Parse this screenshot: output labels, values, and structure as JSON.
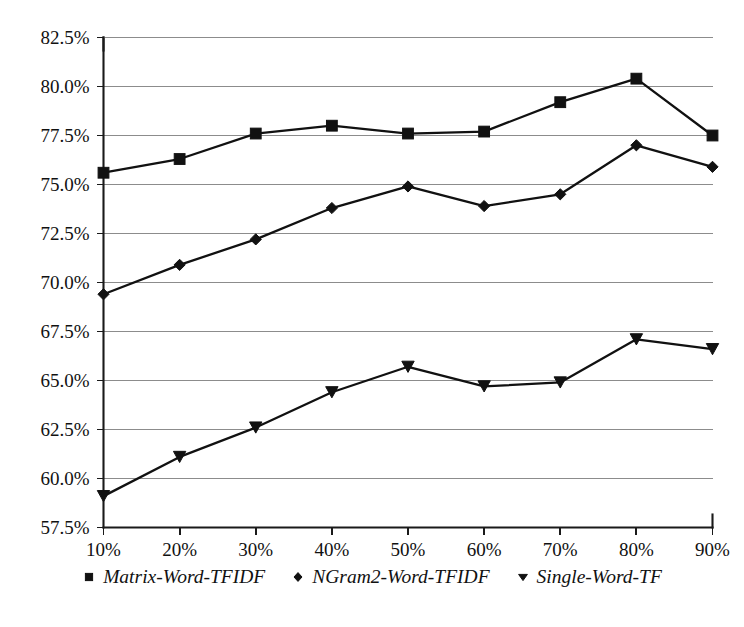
{
  "chart_data": {
    "type": "line",
    "title": "",
    "xlabel": "",
    "ylabel": "",
    "categories": [
      "10%",
      "20%",
      "30%",
      "40%",
      "50%",
      "60%",
      "70%",
      "80%",
      "90%"
    ],
    "x": [
      10,
      20,
      30,
      40,
      50,
      60,
      70,
      80,
      90
    ],
    "xlim": [
      10,
      90
    ],
    "ylim": [
      57.5,
      82.5
    ],
    "grid": true,
    "legend_position": "bottom",
    "y_ticks": [
      57.5,
      60.0,
      62.5,
      65.0,
      67.5,
      70.0,
      72.5,
      75.0,
      77.5,
      80.0,
      82.5
    ],
    "y_tick_labels": [
      "57.5%",
      "60.0%",
      "62.5%",
      "65.0%",
      "67.5%",
      "70.0%",
      "72.5%",
      "75.0%",
      "77.5%",
      "80.0%",
      "82.5%"
    ],
    "x_tick_labels": [
      "10%",
      "20%",
      "30%",
      "40%",
      "50%",
      "60%",
      "70%",
      "80%",
      "90%"
    ],
    "series": [
      {
        "name": "Matrix-Word-TFIDF",
        "marker": "square",
        "values": [
          75.6,
          76.3,
          77.6,
          78.0,
          77.6,
          77.7,
          79.2,
          80.4,
          77.5
        ]
      },
      {
        "name": "NGram2-Word-TFIDF",
        "marker": "diamond",
        "values": [
          69.4,
          70.9,
          72.2,
          73.8,
          74.9,
          73.9,
          74.5,
          77.0,
          75.9
        ]
      },
      {
        "name": "Single-Word-TF",
        "marker": "triangle-down",
        "values": [
          59.1,
          61.1,
          62.6,
          64.4,
          65.7,
          64.7,
          64.9,
          67.1,
          66.6
        ]
      }
    ]
  },
  "legend": {
    "entries": [
      {
        "label": "Matrix-Word-TFIDF",
        "marker": "square"
      },
      {
        "label": "NGram2-Word-TFIDF",
        "marker": "diamond"
      },
      {
        "label": "Single-Word-TF",
        "marker": "triangle-down"
      }
    ]
  },
  "colors": {
    "line": "#111111",
    "grid": "#8c8c8c",
    "axis": "#1a1a1a",
    "background": "#ffffff"
  }
}
